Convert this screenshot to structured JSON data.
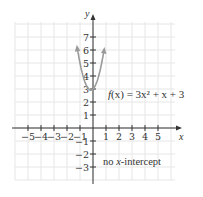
{
  "chart_data": {
    "type": "line",
    "title": "",
    "function": "f(x) = 3x^2 + x + 3",
    "series": [
      {
        "name": "f(x) = 3x^2 + x + 3",
        "x": [
          -1.2,
          -1.0,
          -0.8,
          -0.6,
          -0.4,
          -0.1667,
          0.0,
          0.2,
          0.4,
          0.6,
          0.8,
          1.0
        ],
        "y": [
          6.12,
          5.0,
          4.12,
          3.48,
          3.08,
          2.92,
          3.0,
          3.32,
          3.88,
          4.68,
          5.72,
          7.0
        ]
      }
    ],
    "xlabel": "x",
    "ylabel": "y",
    "xlim": [
      -6,
      6
    ],
    "ylim": [
      -4,
      8
    ],
    "xticks": [
      -5,
      -4,
      -3,
      -2,
      -1,
      1,
      2,
      3,
      4,
      5
    ],
    "yticks": [
      -3,
      -2,
      -1,
      1,
      2,
      3,
      4,
      5,
      6,
      7
    ],
    "grid": true,
    "legend": null,
    "annotations": [
      "f(x) = 3x^2 + x + 3",
      "no x-intercept"
    ],
    "colors": {
      "curve": "#9a9a9a",
      "axis": "#333333",
      "grid": "#e6e6e6"
    }
  },
  "labels": {
    "x_axis": "x",
    "y_axis": "y",
    "function_prefix": "f",
    "function_text": "(x) = 3x² + x + 3",
    "note_prefix": "no ",
    "note_var": "x",
    "note_suffix": "-intercept"
  }
}
